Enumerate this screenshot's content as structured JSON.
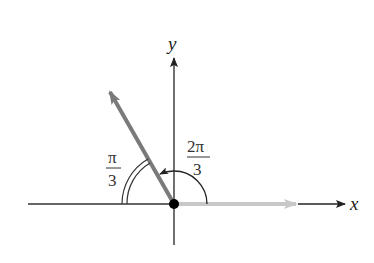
{
  "diagram": {
    "axes": {
      "x_label": "x",
      "y_label": "y"
    },
    "angles": [
      {
        "name": "standard-angle",
        "label_num": "2π",
        "label_den": "3",
        "radians": "2π/3",
        "arc": "single arc with arrowhead, counterclockwise from positive x-axis"
      },
      {
        "name": "reference-angle",
        "label_num": "π",
        "label_den": "3",
        "radians": "π/3",
        "arc": "double arc between terminal side and negative x-axis"
      }
    ],
    "vectors": [
      {
        "name": "initial-side",
        "direction_deg": 0,
        "color": "#c8c8c8"
      },
      {
        "name": "terminal-side",
        "direction_deg": 120,
        "color": "#7a7a7a"
      }
    ],
    "colors": {
      "axis": "#333333",
      "terminal": "#7a7a7a",
      "initial": "#c8c8c8",
      "origin_dot": "#000000"
    }
  }
}
